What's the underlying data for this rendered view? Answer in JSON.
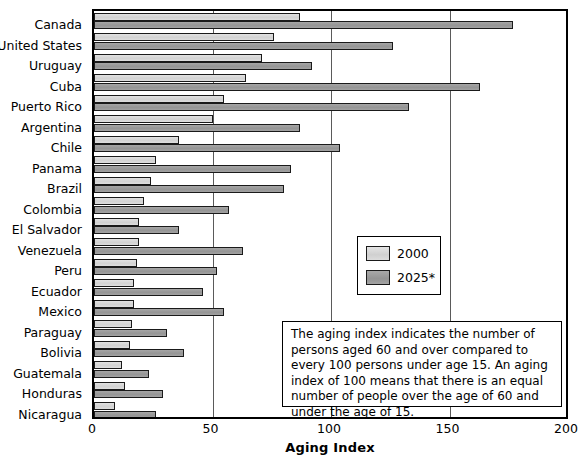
{
  "chart_data": {
    "type": "bar",
    "orientation": "horizontal",
    "title": "",
    "xlabel": "Aging Index",
    "ylabel": "",
    "xlim": [
      0,
      200
    ],
    "xticks": [
      0,
      50,
      100,
      150,
      200
    ],
    "grid": true,
    "grid_axis": "x",
    "legend_position": "center-right",
    "categories": [
      "Canada",
      "United States",
      "Uruguay",
      "Cuba",
      "Puerto Rico",
      "Argentina",
      "Chile",
      "Panama",
      "Brazil",
      "Colombia",
      "El Salvador",
      "Venezuela",
      "Peru",
      "Ecuador",
      "Mexico",
      "Paraguay",
      "Bolivia",
      "Guatemala",
      "Honduras",
      "Nicaragua"
    ],
    "series": [
      {
        "name": "2000",
        "color": "#d4d4d4",
        "values": [
          87,
          76,
          71,
          64,
          55,
          50,
          36,
          26,
          24,
          21,
          19,
          19,
          18,
          17,
          17,
          16,
          15,
          12,
          13,
          9
        ]
      },
      {
        "name": "2025*",
        "color": "#979797",
        "values": [
          177,
          126,
          92,
          163,
          133,
          87,
          104,
          83,
          80,
          57,
          36,
          63,
          52,
          46,
          55,
          31,
          38,
          23,
          29,
          26
        ]
      }
    ],
    "annotations": [
      {
        "name": "aging-index-definition",
        "text": "The aging index indicates the number of persons aged 60 and over compared to every 100 persons under age 15. An aging index of 100 means that there is an equal number of people over the age of 60 and under the age of 15."
      }
    ]
  },
  "legend": {
    "items": [
      {
        "label": "2000",
        "swatch": "light-gray-swatch"
      },
      {
        "label": "2025*",
        "swatch": "dark-gray-swatch"
      }
    ]
  },
  "axis": {
    "x_title": "Aging Index",
    "x_tick_labels": [
      "0",
      "50",
      "100",
      "150",
      "200"
    ]
  },
  "note": {
    "text": "The aging index indicates the number of persons aged 60 and over compared to every 100 persons under age 15. An aging index of 100 means that there is an equal number of people over the age of 60 and under the age of 15."
  }
}
